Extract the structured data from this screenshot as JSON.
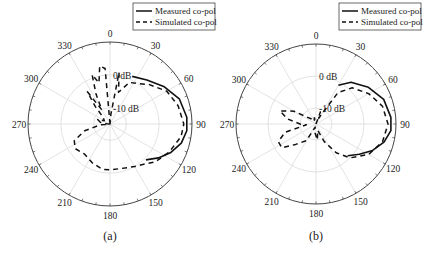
{
  "figure": {
    "panels": [
      {
        "id": "a",
        "caption": "(a)"
      },
      {
        "id": "b",
        "caption": "(b)"
      }
    ]
  },
  "chart_data": [
    {
      "type": "polar",
      "panel": "(a)",
      "title": "",
      "angle_ticks": [
        0,
        30,
        60,
        90,
        120,
        150,
        180,
        210,
        240,
        270,
        300,
        330
      ],
      "angle_direction": "clockwise",
      "zero_location": "top",
      "radial_labels": [
        "0 dB",
        "-10 dB"
      ],
      "radial_range_db": [
        -15,
        10
      ],
      "rings_db": [
        -10,
        0,
        10
      ],
      "grid": true,
      "legend": {
        "position": "upper right",
        "entries": [
          "Measured co-pol",
          "Simulated co-pol"
        ]
      },
      "series": [
        {
          "name": "Measured co-pol",
          "style": "solid",
          "points": [
            [
              25,
              1
            ],
            [
              40,
              2.5
            ],
            [
              55,
              5
            ],
            [
              70,
              7.5
            ],
            [
              85,
              8.5
            ],
            [
              95,
              8.5
            ],
            [
              105,
              7.5
            ],
            [
              115,
              5.5
            ],
            [
              125,
              3
            ],
            [
              135,
              0.5
            ]
          ]
        },
        {
          "name": "Simulated co-pol",
          "style": "dashed",
          "points": [
            [
              0,
              -15
            ],
            [
              355,
              2
            ],
            [
              350,
              3
            ],
            [
              345,
              -2
            ],
            [
              340,
              1
            ],
            [
              335,
              -5
            ],
            [
              330,
              -10
            ],
            [
              325,
              -3
            ],
            [
              320,
              -8
            ],
            [
              315,
              -12
            ],
            [
              300,
              -13
            ],
            [
              290,
              -11
            ],
            [
              280,
              -12
            ],
            [
              275,
              -14
            ],
            [
              270,
              -15
            ],
            [
              265,
              -12
            ],
            [
              255,
              -7
            ],
            [
              245,
              -3
            ],
            [
              235,
              -2
            ],
            [
              220,
              -3
            ],
            [
              205,
              -2
            ],
            [
              190,
              -1
            ],
            [
              180,
              -1
            ],
            [
              165,
              -1
            ],
            [
              150,
              0
            ],
            [
              140,
              1
            ],
            [
              130,
              3
            ],
            [
              115,
              5
            ],
            [
              100,
              7
            ],
            [
              90,
              7.5
            ],
            [
              75,
              6.5
            ],
            [
              60,
              5
            ],
            [
              45,
              2
            ],
            [
              35,
              0
            ],
            [
              25,
              -1
            ],
            [
              15,
              -5
            ],
            [
              10,
              1
            ],
            [
              5,
              -12
            ],
            [
              0,
              -15
            ]
          ]
        }
      ]
    },
    {
      "type": "polar",
      "panel": "(b)",
      "title": "",
      "angle_ticks": [
        0,
        30,
        60,
        90,
        120,
        150,
        180,
        210,
        240,
        270,
        300,
        330
      ],
      "angle_direction": "clockwise",
      "zero_location": "top",
      "radial_labels": [
        "0 dB",
        "-10 dB"
      ],
      "radial_range_db": [
        -15,
        10
      ],
      "rings_db": [
        -10,
        0,
        10
      ],
      "grid": true,
      "legend": {
        "position": "upper right",
        "entries": [
          "Measured co-pol",
          "Simulated co-pol"
        ]
      },
      "series": [
        {
          "name": "Measured co-pol",
          "style": "solid",
          "points": [
            [
              30,
              -1
            ],
            [
              40,
              2
            ],
            [
              55,
              5
            ],
            [
              70,
              7.5
            ],
            [
              85,
              8.5
            ],
            [
              95,
              8.5
            ],
            [
              105,
              7
            ],
            [
              115,
              4.5
            ],
            [
              125,
              1.5
            ],
            [
              135,
              -1
            ]
          ]
        },
        {
          "name": "Simulated co-pol",
          "style": "dashed",
          "points": [
            [
              0,
              -15
            ],
            [
              20,
              -11
            ],
            [
              25,
              -13
            ],
            [
              35,
              -3
            ],
            [
              45,
              1
            ],
            [
              60,
              4
            ],
            [
              75,
              6.5
            ],
            [
              90,
              7.5
            ],
            [
              105,
              6.5
            ],
            [
              120,
              4
            ],
            [
              135,
              0
            ],
            [
              145,
              -4
            ],
            [
              155,
              -9
            ],
            [
              165,
              -13
            ],
            [
              175,
              -10
            ],
            [
              185,
              -12
            ],
            [
              195,
              -14
            ],
            [
              210,
              -9
            ],
            [
              225,
              -6
            ],
            [
              235,
              -2
            ],
            [
              245,
              -2
            ],
            [
              255,
              -5
            ],
            [
              265,
              -12
            ],
            [
              270,
              -10
            ],
            [
              280,
              -6
            ],
            [
              290,
              -3
            ],
            [
              300,
              -7
            ],
            [
              310,
              -12
            ],
            [
              320,
              -13
            ],
            [
              330,
              -14
            ],
            [
              345,
              -13
            ],
            [
              355,
              -14
            ],
            [
              0,
              -15
            ]
          ]
        }
      ]
    }
  ]
}
